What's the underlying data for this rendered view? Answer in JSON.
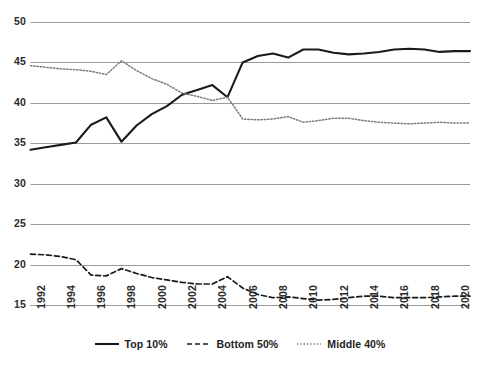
{
  "chart_data": {
    "type": "line",
    "title": "",
    "subtitle": "",
    "xlabel": "",
    "ylabel": "",
    "xlim": [
      1992,
      2021
    ],
    "ylim": [
      15,
      50
    ],
    "ytick_labels": [
      "50",
      "45",
      "40",
      "35",
      "30",
      "25",
      "20",
      "15"
    ],
    "ytick_values": [
      50,
      45,
      40,
      35,
      30,
      25,
      20,
      15
    ],
    "xtick_labels": [
      "1992",
      "1994",
      "1996",
      "1998",
      "2000",
      "2002",
      "2004",
      "2006",
      "2008",
      "2010",
      "2012",
      "2014",
      "2016",
      "2018",
      "2020"
    ],
    "xtick_values": [
      1992,
      1994,
      1996,
      1998,
      2000,
      2002,
      2004,
      2006,
      2008,
      2010,
      2012,
      2014,
      2016,
      2018,
      2020
    ],
    "grid": true,
    "legend_position": "bottom",
    "x": [
      1992,
      1993,
      1994,
      1995,
      1996,
      1997,
      1998,
      1999,
      2000,
      2001,
      2002,
      2003,
      2004,
      2005,
      2006,
      2007,
      2008,
      2009,
      2010,
      2011,
      2012,
      2013,
      2014,
      2015,
      2016,
      2017,
      2018,
      2019,
      2020,
      2021
    ],
    "series": [
      {
        "name": "Top 10%",
        "style": "solid",
        "color": "#1a1a1a",
        "values": [
          34.2,
          34.5,
          34.8,
          35.1,
          37.3,
          38.2,
          35.2,
          37.2,
          38.6,
          39.6,
          41.0,
          41.6,
          42.2,
          40.7,
          45.0,
          45.8,
          46.1,
          45.6,
          46.6,
          46.6,
          46.2,
          46.0,
          46.1,
          46.3,
          46.6,
          46.7,
          46.6,
          46.3,
          46.4,
          46.4
        ]
      },
      {
        "name": "Bottom 50%",
        "style": "dashed",
        "color": "#1a1a1a",
        "values": [
          21.3,
          21.2,
          21.0,
          20.6,
          18.7,
          18.6,
          19.5,
          18.9,
          18.4,
          18.1,
          17.8,
          17.6,
          17.6,
          18.5,
          17.1,
          16.3,
          15.9,
          16.0,
          15.8,
          15.6,
          15.7,
          15.9,
          16.1,
          16.1,
          15.9,
          15.9,
          15.9,
          16.0,
          16.1,
          16.1
        ]
      },
      {
        "name": "Middle 40%",
        "style": "dotted",
        "color": "#7a7a7a",
        "values": [
          44.6,
          44.4,
          44.2,
          44.1,
          43.9,
          43.5,
          45.2,
          44.0,
          43.0,
          42.3,
          41.2,
          40.8,
          40.3,
          40.7,
          38.0,
          37.9,
          38.0,
          38.3,
          37.6,
          37.8,
          38.1,
          38.1,
          37.8,
          37.6,
          37.5,
          37.4,
          37.5,
          37.6,
          37.5,
          37.5
        ]
      }
    ]
  },
  "legend": {
    "items": [
      {
        "label": "Top 10%",
        "style": "solid"
      },
      {
        "label": "Bottom 50%",
        "style": "dashed"
      },
      {
        "label": "Middle 40%",
        "style": "dotted"
      }
    ]
  }
}
